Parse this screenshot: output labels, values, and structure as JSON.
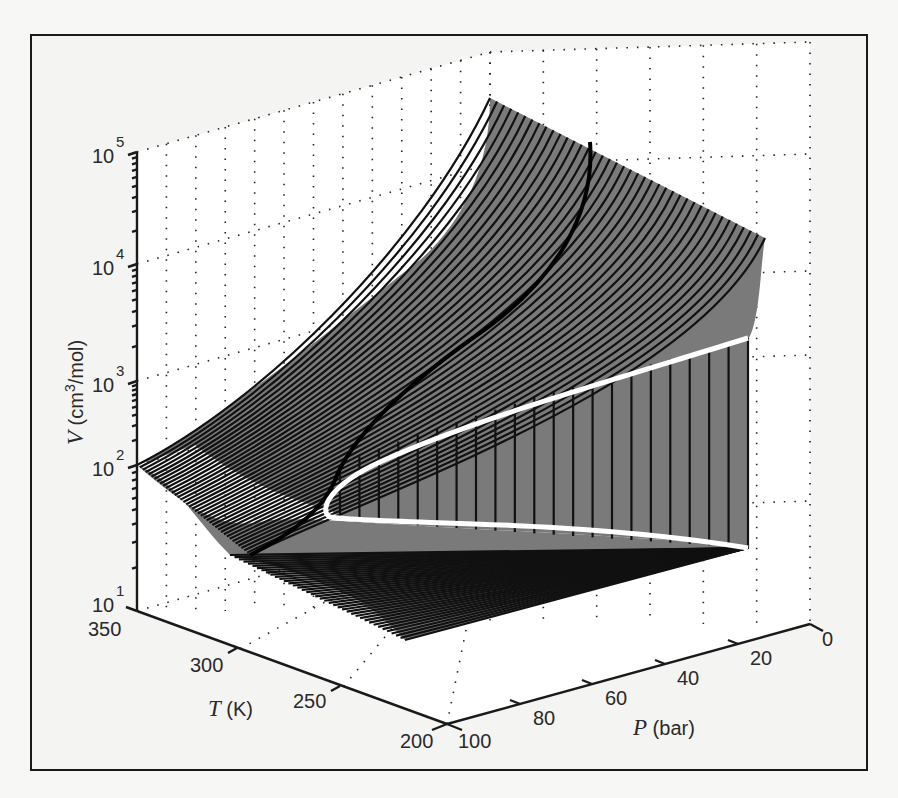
{
  "chart_data": {
    "type": "surface3d",
    "title": "",
    "axes": {
      "x": {
        "label_var": "P",
        "label_unit": "(bar)",
        "ticks": [
          0,
          20,
          40,
          60,
          80,
          100
        ],
        "range": [
          0,
          100
        ]
      },
      "y": {
        "label_var": "T",
        "label_unit": "(K)",
        "ticks": [
          200,
          250,
          300,
          350
        ],
        "range": [
          200,
          350
        ]
      },
      "z": {
        "label_var": "V",
        "label_unit_prefix": "(cm",
        "label_unit_exp": "3",
        "label_unit_suffix": "/mol)",
        "scale": "log",
        "ticks": [
          {
            "base": "10",
            "exp": "1"
          },
          {
            "base": "10",
            "exp": "2"
          },
          {
            "base": "10",
            "exp": "3"
          },
          {
            "base": "10",
            "exp": "4"
          },
          {
            "base": "10",
            "exp": "5"
          }
        ],
        "range": [
          10,
          100000
        ]
      }
    },
    "grid": "dotted",
    "surface_color": "#7a7a7a",
    "isotherm_color": "#111111",
    "two_phase_boundary_color": "#ffffff",
    "isotherm_count": 40,
    "critical_point": {
      "approx_T": 300,
      "approx_P": 50,
      "approx_V": 100
    },
    "legend": null
  },
  "labels": {
    "v_tick_base": "10",
    "v_exp": [
      "5",
      "4",
      "3",
      "2",
      "1"
    ],
    "t_ticks": [
      "350",
      "300",
      "250",
      "200"
    ],
    "p_ticks": [
      "100",
      "80",
      "60",
      "40",
      "20",
      "0"
    ],
    "v_title_var": "V",
    "v_title_unit_a": " (cm",
    "v_title_unit_exp": "3",
    "v_title_unit_b": "/mol)",
    "t_title_var": "T",
    "t_title_unit": " (K)",
    "p_title_var": "P",
    "p_title_unit": " (bar)"
  }
}
